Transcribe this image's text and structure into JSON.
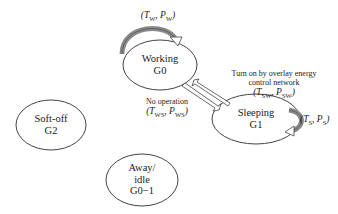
{
  "diagram": {
    "states": [
      {
        "id": "working",
        "name": "Working",
        "code": "G0"
      },
      {
        "id": "sleeping",
        "name": "Sleeping",
        "code": "G1"
      },
      {
        "id": "softoff",
        "name": "Soft-off",
        "code": "G2"
      },
      {
        "id": "away",
        "name": "Away/",
        "name2": "idle",
        "code": "G0−1"
      }
    ],
    "self_loops": {
      "working": {
        "open": "(",
        "T": "T",
        "T_sub": "W",
        "sep": ", ",
        "P": "P",
        "P_sub": "W",
        "close": ")"
      },
      "sleeping": {
        "open": "(",
        "T": "T",
        "T_sub": "S",
        "sep": ", ",
        "P": "P",
        "P_sub": "S",
        "close": ")"
      }
    },
    "transitions": {
      "sleep_to_work": {
        "line1": "Turn on by overlay energy",
        "line2": "control network",
        "open": "(",
        "T": "T",
        "T_sub": "SW",
        "sep": ", ",
        "P": "P",
        "P_sub": "SW",
        "close": ")"
      },
      "work_to_sleep": {
        "line1": "No operation",
        "open": "(",
        "T": "T",
        "T_sub": "WS",
        "sep": ", ",
        "P": "P",
        "P_sub": "WS",
        "close": ")"
      }
    },
    "colors": {
      "stroke": "#444444",
      "loop_fill": "#8a8a8a"
    }
  }
}
